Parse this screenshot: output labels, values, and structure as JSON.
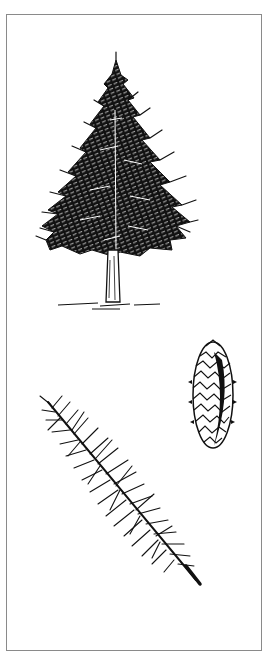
{
  "plate": {
    "title": "Conifer botanical illustration",
    "border_color": "#8a8a8a",
    "ink_color": "#111111",
    "background": "#ffffff"
  },
  "figures": [
    {
      "id": "tree",
      "label": "Mature tree (conical conifer silhouette)"
    },
    {
      "id": "cone",
      "label": "Seed cone"
    },
    {
      "id": "branch",
      "label": "Needle-bearing branch twig"
    }
  ]
}
